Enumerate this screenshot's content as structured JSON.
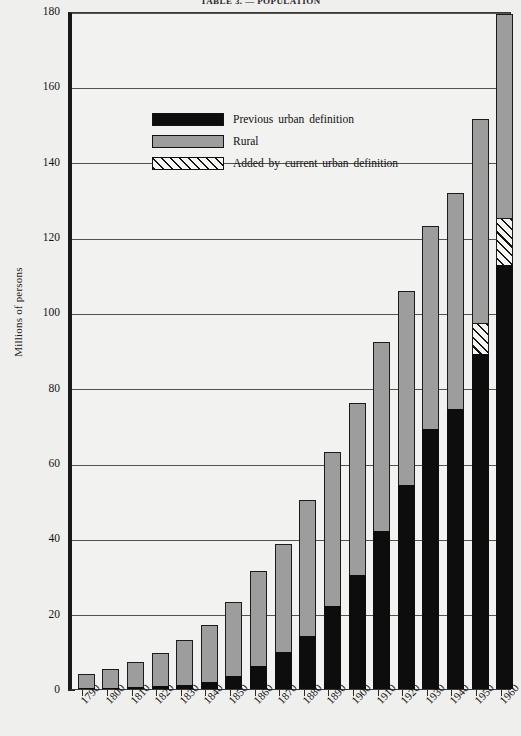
{
  "title_partial": "TABLE 3. — POPULATION",
  "legend": {
    "items": [
      {
        "label": "Previous  urban  definition",
        "swatch": "black-square",
        "color": "#0d0d0d"
      },
      {
        "label": "Rural",
        "swatch": "gray-square",
        "color": "#9d9d9d"
      },
      {
        "label": "Added  by  current  urban  definition",
        "swatch": "diagonal-hatch-square",
        "color": "#141414"
      }
    ]
  },
  "chart_data": {
    "type": "bar",
    "stacked": true,
    "title": "TABLE 3. — POPULATION",
    "xlabel": "",
    "ylabel": "Millions of persons",
    "ylim": [
      0,
      180
    ],
    "ytick_labels": [
      "0",
      "20",
      "40",
      "60",
      "80",
      "100",
      "120",
      "140",
      "160",
      "180"
    ],
    "ytick_values": [
      0,
      20,
      40,
      60,
      80,
      100,
      120,
      140,
      160,
      180
    ],
    "grid": "horizontal",
    "legend_position": "upper-left-inside",
    "categories": [
      "1790",
      "1800",
      "1810",
      "1820",
      "1830",
      "1840",
      "1850",
      "1860",
      "1870",
      "1880",
      "1890",
      "1900",
      "1910",
      "1920",
      "1930",
      "1940",
      "1950",
      "1960"
    ],
    "series": [
      {
        "name": "Previous urban definition",
        "color": "#0d0d0d",
        "values": [
          0.2,
          0.3,
          0.5,
          0.7,
          1.1,
          1.8,
          3.5,
          6.2,
          9.9,
          14.1,
          22.1,
          30.2,
          42.0,
          54.2,
          69.0,
          74.4,
          89.0,
          112.6
        ]
      },
      {
        "name": "Rural",
        "color": "#9d9d9d",
        "values": [
          3.7,
          5.0,
          6.7,
          8.9,
          11.8,
          15.3,
          19.7,
          25.2,
          28.7,
          36.1,
          40.8,
          45.8,
          50.0,
          51.5,
          53.8,
          57.3,
          54.2,
          54.1
        ]
      },
      {
        "name": "Added by current urban definition",
        "color": "#141414",
        "hatch": "diagonal",
        "values": [
          0,
          0,
          0,
          0,
          0,
          0,
          0,
          0,
          0,
          0,
          0,
          0,
          0,
          0,
          0,
          0,
          8.1,
          12.4
        ]
      }
    ],
    "totals": [
      3.9,
      5.3,
      7.2,
      9.6,
      12.9,
      17.1,
      23.2,
      31.4,
      38.6,
      50.2,
      62.9,
      76.0,
      92.0,
      105.7,
      122.8,
      131.7,
      151.3,
      179.3
    ]
  }
}
